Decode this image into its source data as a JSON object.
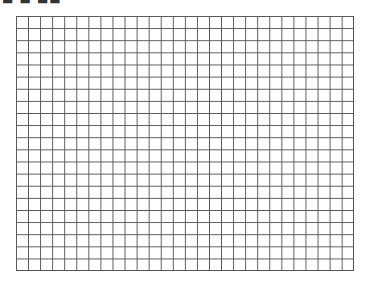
{
  "header": {
    "title_fragment": "■ ■ ■■"
  },
  "grid": {
    "columns": 28,
    "rows": 21,
    "line_color": "#555555",
    "background": "#ffffff"
  }
}
